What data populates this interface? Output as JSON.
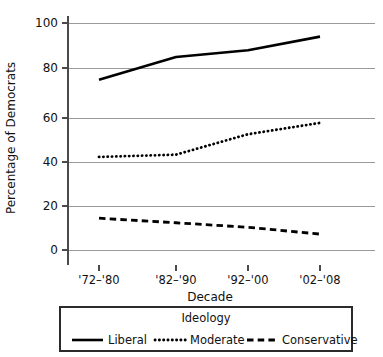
{
  "chart_data": {
    "type": "line",
    "title": "",
    "xlabel": "Decade",
    "ylabel": "Percentage of Democrats",
    "categories": [
      "'72–'80",
      "'82–'90",
      "'92–'00",
      "'02–'08"
    ],
    "series": [
      {
        "name": "Liberal",
        "values": [
          75,
          85,
          88,
          94
        ],
        "style": "solid"
      },
      {
        "name": "Moderate",
        "values": [
          41,
          42,
          51,
          56
        ],
        "style": "dotted"
      },
      {
        "name": "Conservative",
        "values": [
          14,
          12,
          10,
          7
        ],
        "style": "dashed"
      }
    ],
    "ylim": [
      0,
      100
    ],
    "yticks": [
      0,
      20,
      40,
      60,
      80,
      100
    ],
    "ytick_labels": [
      "0",
      "20",
      "40",
      "60",
      "80",
      "100"
    ],
    "grid": "horizontal",
    "legend_position": "bottom",
    "legend_title": "Ideology",
    "colors": {
      "line": "#000000",
      "grid": "#9a9a9a",
      "axis": "#4a4a4a",
      "text": "#111111",
      "background": "#ffffff"
    }
  },
  "axes": {
    "y_title": "Percentage of Democrats",
    "x_title": "Decade",
    "y_tick_labels": [
      "100",
      "80",
      "60",
      "40",
      "20",
      "0"
    ],
    "x_tick_labels": [
      "'72–'80",
      "'82–'90",
      "'92–'00",
      "'02–'08"
    ]
  },
  "legend": {
    "title": "Ideology",
    "entries": [
      {
        "label": "Liberal",
        "style": "solid"
      },
      {
        "label": "Moderate",
        "style": "dotted"
      },
      {
        "label": "Conservative",
        "style": "dashed"
      }
    ]
  }
}
